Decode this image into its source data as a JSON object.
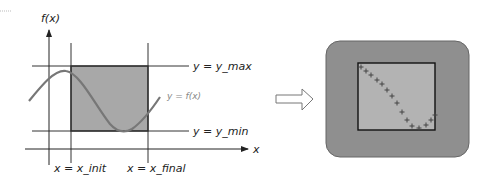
{
  "left_diagram": {
    "y_axis_label": "f(x)",
    "x_axis_label": "x",
    "y_max_label": "y = y_max",
    "y_min_label": "y = y_min",
    "x_init_label": "x = x_init",
    "x_final_label": "x = x_final",
    "curve_label": "y = f(x)",
    "colors": {
      "shaded_region": "#a8a8a8",
      "curve": "#777777",
      "lines": "#333333"
    }
  },
  "arrow": {
    "icon": "hollow-right-arrow-icon"
  },
  "right_diagram": {
    "outer_fill": "#8f8f8f",
    "inner_fill": "#b3b3b3",
    "marker": "+",
    "points": [
      [
        361,
        67
      ],
      [
        366,
        71
      ],
      [
        371,
        75
      ],
      [
        377,
        80
      ],
      [
        382,
        84
      ],
      [
        387,
        90
      ],
      [
        392,
        96
      ],
      [
        397,
        103
      ],
      [
        402,
        112
      ],
      [
        407,
        120
      ],
      [
        412,
        126
      ],
      [
        419,
        128
      ],
      [
        426,
        125
      ],
      [
        431,
        120
      ],
      [
        435,
        115
      ]
    ]
  }
}
